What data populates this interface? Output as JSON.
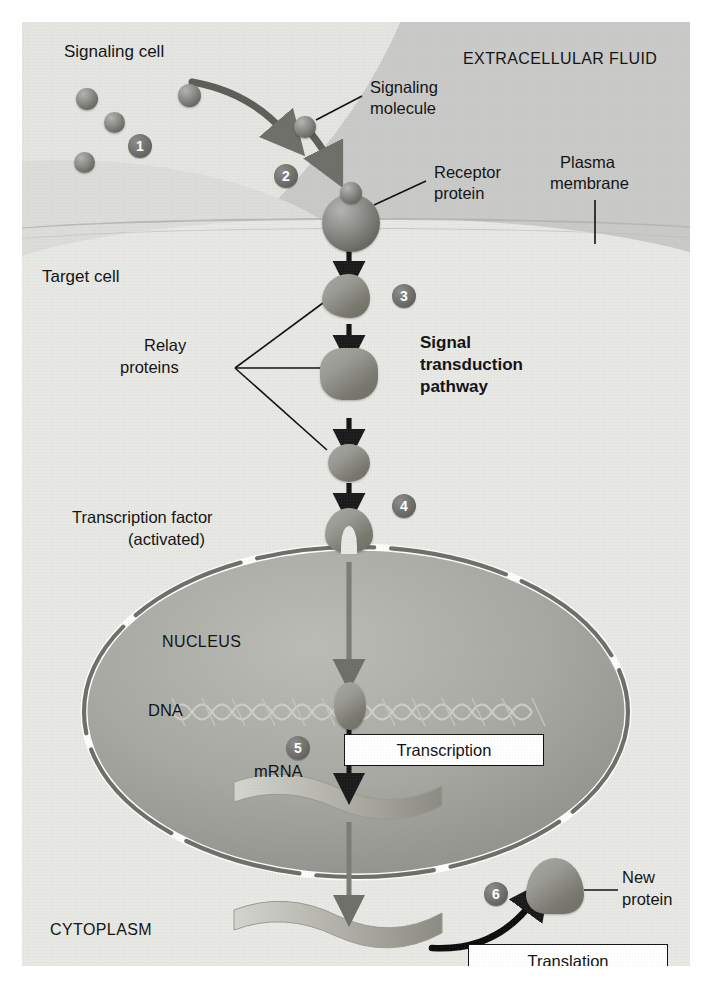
{
  "figure": {
    "type": "cell-signaling-diagram",
    "title_partial_cut_off_at_top": "",
    "regions": {
      "extracellular_fluid": "EXTRACELLULAR FLUID",
      "cytoplasm": "CYTOPLASM",
      "nucleus": "NUCLEUS"
    },
    "labels": {
      "signaling_cell": "Signaling cell",
      "signaling_molecule_l1": "Signaling",
      "signaling_molecule_l2": "molecule",
      "receptor_protein_l1": "Receptor",
      "receptor_protein_l2": "protein",
      "plasma_membrane_l1": "Plasma",
      "plasma_membrane_l2": "membrane",
      "target_cell": "Target cell",
      "relay_proteins_l1": "Relay",
      "relay_proteins_l2": "proteins",
      "signal_transduction_l1": "Signal",
      "signal_transduction_l2": "transduction",
      "signal_transduction_l3": "pathway",
      "transcription_factor_l1": "Transcription factor",
      "transcription_factor_l2": "(activated)",
      "dna": "DNA",
      "mrna": "mRNA",
      "new_protein_l1": "New",
      "new_protein_l2": "protein"
    },
    "process_boxes": {
      "transcription": "Transcription",
      "translation": "Translation"
    },
    "steps": [
      {
        "number": "1",
        "meaning": "signaling molecule released by signaling cell"
      },
      {
        "number": "2",
        "meaning": "signaling molecule binds receptor protein"
      },
      {
        "number": "3",
        "meaning": "signal transduction pathway via relay proteins"
      },
      {
        "number": "4",
        "meaning": "transcription factor activated"
      },
      {
        "number": "5",
        "meaning": "transcription of DNA to mRNA"
      },
      {
        "number": "6",
        "meaning": "translation of mRNA to new protein"
      }
    ],
    "colors": {
      "extracellular_fluid": "#c9c9c7",
      "signaling_cell": "#e4e4e1",
      "target_cell_cytoplasm": "#e7e7e4",
      "nucleus_fill": "#a6a6a1",
      "protein_fill": "#8e8e8a",
      "badge_fill": "#63635f",
      "text": "#131313",
      "box_background": "#ffffff",
      "box_border": "#111111"
    },
    "counts": {
      "signaling_molecules_in_cell": 4,
      "relay_proteins": 3,
      "nuclear_pores": 8
    }
  }
}
